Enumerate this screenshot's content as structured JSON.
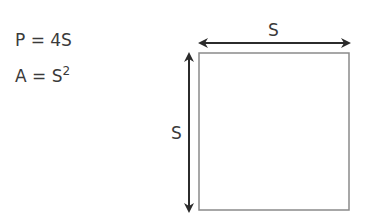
{
  "formulas": {
    "perimeter": "P = 4S",
    "area_base": "A = S",
    "area_exp": "2"
  },
  "diagram": {
    "shape": "square",
    "top_label": "S",
    "side_label": "S",
    "stroke_color": "#8a8a8a",
    "arrow_color": "#2b2b2b"
  }
}
